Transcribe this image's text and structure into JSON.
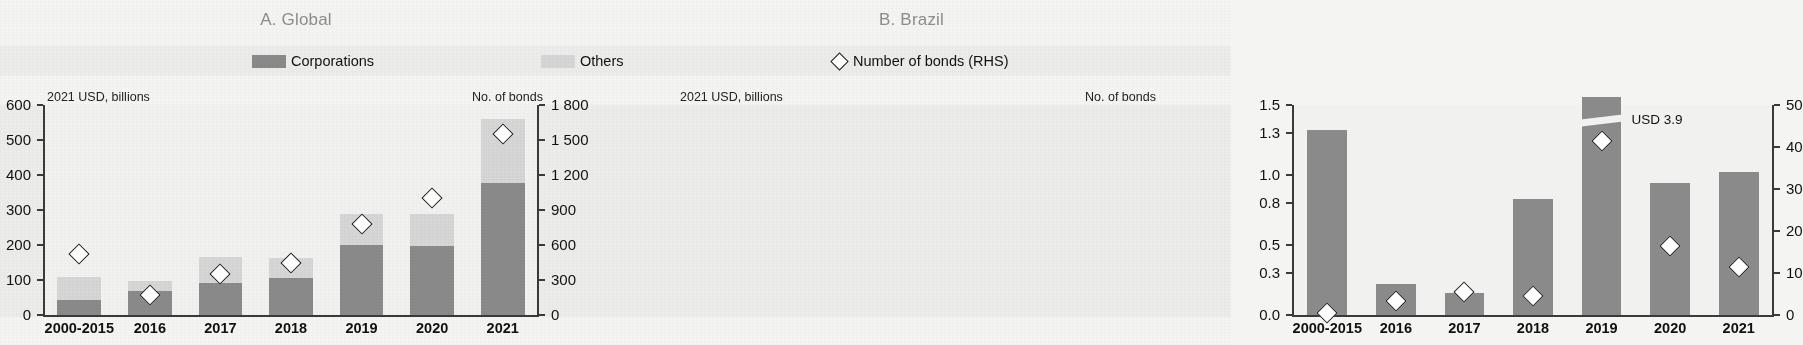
{
  "figure": {
    "background_color": "#f4f4f2",
    "bar_color_corporations": "#8a8a8a",
    "bar_color_others": "#d6d6d6",
    "marker_color": "#ffffff",
    "axis_color": "#3a3a3a",
    "title_color": "#8d8d8d"
  },
  "legend": {
    "corporations_label": "Corporations",
    "others_label": "Others",
    "bonds_label": "Number of bonds (RHS)",
    "bonds_marker_icon": "diamond-outline-icon"
  },
  "panels": {
    "global": {
      "title": "A. Global",
      "left_axis_unit": "2021 USD, billions",
      "right_axis_unit": "No. of bonds"
    },
    "brazil": {
      "title": "B. Brazil",
      "left_axis_unit": "2021 USD, billions",
      "right_axis_unit": "No. of bonds",
      "annotation": "USD 3.9"
    }
  },
  "chart_data": [
    {
      "type": "bar",
      "title": "A. Global",
      "subtitle": "",
      "xlabel": "",
      "ylabel": "2021 USD, billions",
      "y2label": "No. of bonds",
      "grid": false,
      "legend_position": "top-center",
      "categories": [
        "2000-2015",
        "2016",
        "2017",
        "2018",
        "2019",
        "2020",
        "2021"
      ],
      "ylim": [
        0,
        600
      ],
      "yticks": [
        0,
        100,
        200,
        300,
        400,
        500,
        600
      ],
      "ytick_labels": [
        "0",
        "100",
        "200",
        "300",
        "400",
        "500",
        "600"
      ],
      "y2lim": [
        0,
        1800
      ],
      "y2ticks": [
        0,
        300,
        600,
        900,
        1200,
        1500,
        1800
      ],
      "y2tick_labels": [
        "0",
        "300",
        "600",
        "900",
        "1 200",
        "1 500",
        "1 800"
      ],
      "stacked": true,
      "series": [
        {
          "name": "Corporations",
          "axis": "left",
          "color": "#8a8a8a",
          "values": [
            42,
            68,
            92,
            107,
            200,
            196,
            377
          ]
        },
        {
          "name": "Others",
          "axis": "left",
          "color": "#d6d6d6",
          "values": [
            66,
            30,
            73,
            57,
            90,
            93,
            184
          ]
        },
        {
          "name": "Number of bonds (RHS)",
          "axis": "right",
          "type": "scatter",
          "marker": "diamond",
          "values": [
            580,
            228,
            405,
            505,
            840,
            1055,
            1605
          ]
        }
      ]
    },
    {
      "type": "bar",
      "title": "B. Brazil",
      "subtitle": "",
      "xlabel": "",
      "ylabel": "2021 USD, billions",
      "y2label": "No. of bonds",
      "grid": false,
      "legend_position": "top-center",
      "categories": [
        "2000-2015",
        "2016",
        "2017",
        "2018",
        "2019",
        "2020",
        "2021"
      ],
      "ylim": [
        0,
        1.5
      ],
      "yticks": [
        0.0,
        0.3,
        0.5,
        0.8,
        1.0,
        1.3,
        1.5
      ],
      "ytick_labels": [
        "0.0",
        "0.3",
        "0.5",
        "0.8",
        "1.0",
        "1.3",
        "1.5"
      ],
      "y2lim": [
        0,
        50
      ],
      "y2ticks": [
        0,
        10,
        20,
        30,
        40,
        50
      ],
      "y2tick_labels": [
        "0",
        "10",
        "20",
        "30",
        "40",
        "50"
      ],
      "stacked": false,
      "axis_break": {
        "category": "2019",
        "true_value": 3.9,
        "label": "USD 3.9"
      },
      "series": [
        {
          "name": "Corporations",
          "axis": "left",
          "color": "#8a8a8a",
          "values": [
            1.32,
            0.22,
            0.16,
            0.83,
            3.9,
            0.94,
            1.02
          ]
        },
        {
          "name": "Number of bonds (RHS)",
          "axis": "right",
          "type": "scatter",
          "marker": "diamond",
          "values": [
            2,
            5,
            7,
            6,
            43,
            18,
            13
          ]
        }
      ]
    }
  ]
}
